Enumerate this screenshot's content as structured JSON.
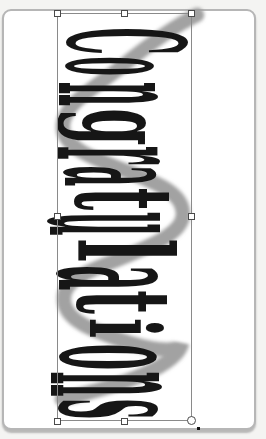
{
  "wordart": {
    "text": "Congratulations",
    "text_color": "#161616",
    "shadow_color": "#9c9c9c"
  },
  "page": {
    "background": "#ffffff",
    "border_color": "#b6b6b6"
  },
  "selection": {
    "outline_color": "#8a8a8a",
    "handle_fill": "#ffffff",
    "handle_border": "#4a4a4a",
    "handles": [
      "top-left",
      "top-center",
      "top-right",
      "middle-left",
      "middle-right",
      "bottom-left",
      "bottom-center",
      "bottom-right"
    ]
  }
}
